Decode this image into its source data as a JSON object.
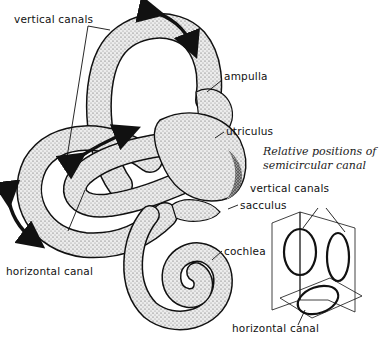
{
  "figure": {
    "labels": {
      "vertical_canals": "vertical canals",
      "ampulla": "ampulla",
      "utriculus": "utriculus",
      "sacculus": "sacculus",
      "cochlea": "cochlea",
      "horizontal_canal": "horizontal canal"
    },
    "inset": {
      "caption_line1": "Relative positions of",
      "caption_line2": "semicircular canal",
      "vertical_canals": "vertical canals",
      "horizontal_canal": "horizontal canal"
    },
    "colors": {
      "ink": "#111111",
      "tube_fill": "#e9e9e9",
      "tube_shade": "#6a6a6a",
      "background": "#ffffff"
    }
  }
}
